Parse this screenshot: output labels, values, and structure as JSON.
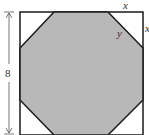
{
  "diagram": {
    "type": "geometry",
    "labels": {
      "side": "8",
      "corner_leg": "x",
      "corner_leg_right": "x",
      "octagon_side": "y"
    },
    "colors": {
      "fill": "#b8b8b8",
      "stroke": "#1a1a1a",
      "background": "#ffffff"
    }
  }
}
